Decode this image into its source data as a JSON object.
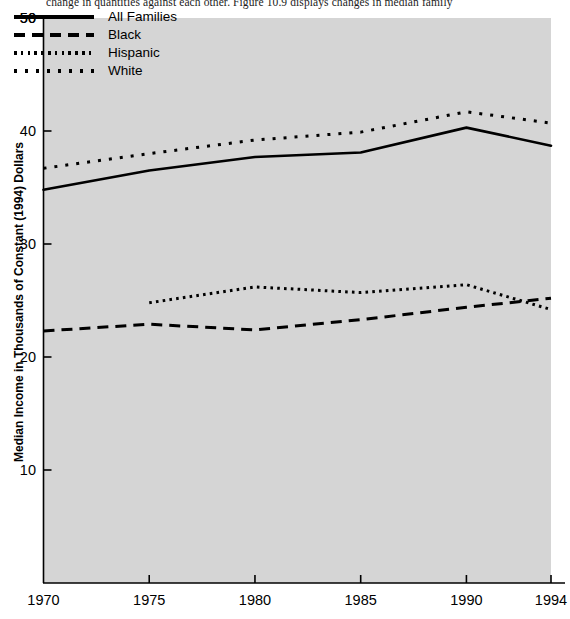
{
  "page": {
    "running_text": "change in quantities against each other. Figure 10.9 displays changes in median family"
  },
  "chart_data": {
    "type": "line",
    "title": "",
    "xlabel": "",
    "ylabel": "Median Income in Thousands of Constant (1994) Dollars",
    "xlim": [
      1970,
      1994
    ],
    "ylim": [
      0,
      50
    ],
    "xticks": [
      1970,
      1975,
      1980,
      1985,
      1990,
      1994
    ],
    "yticks": [
      10,
      20,
      30,
      40,
      50
    ],
    "xtick_labels": [
      "1970",
      "1975",
      "1980",
      "1985",
      "1990",
      "1994"
    ],
    "ytick_labels": [
      "10",
      "20",
      "30",
      "40",
      "50"
    ],
    "grid": false,
    "legend_position": "top-left",
    "plot_bgcolor": "#d5d5d5",
    "line_color": "#000000",
    "series": [
      {
        "name": "All Families",
        "style": "solid",
        "x": [
          1970,
          1975,
          1980,
          1985,
          1990,
          1994
        ],
        "values": [
          34.8,
          36.5,
          37.7,
          38.1,
          40.3,
          38.7
        ]
      },
      {
        "name": "Black",
        "style": "dashed",
        "x": [
          1970,
          1975,
          1980,
          1985,
          1990,
          1994
        ],
        "values": [
          22.3,
          22.9,
          22.4,
          23.3,
          24.4,
          25.2
        ]
      },
      {
        "name": "Hispanic",
        "style": "dotted-fine",
        "x": [
          1975,
          1980,
          1985,
          1990,
          1994
        ],
        "values": [
          24.8,
          26.2,
          25.7,
          26.4,
          24.2
        ]
      },
      {
        "name": "White",
        "style": "dotted-wide",
        "x": [
          1970,
          1975,
          1980,
          1985,
          1990,
          1994
        ],
        "values": [
          36.7,
          38.0,
          39.2,
          39.9,
          41.7,
          40.7
        ]
      }
    ]
  },
  "legend": {
    "items": [
      {
        "label": "All Families",
        "style": "solid"
      },
      {
        "label": "Black",
        "style": "dashed"
      },
      {
        "label": "Hispanic",
        "style": "dotted-fine"
      },
      {
        "label": "White",
        "style": "dotted-wide"
      }
    ]
  }
}
